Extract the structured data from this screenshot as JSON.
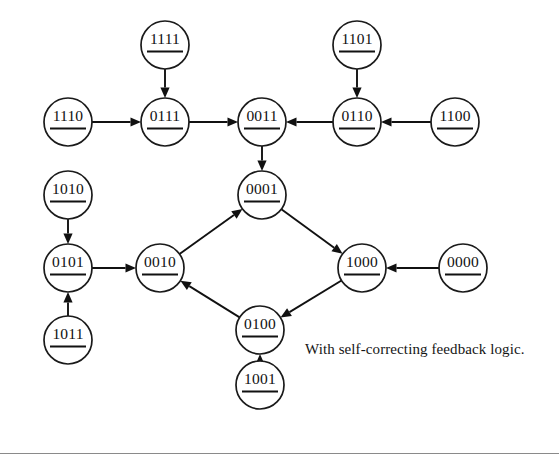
{
  "figure": {
    "caption": "With self-correcting feedback logic.",
    "caption_x": 305,
    "caption_y": 341,
    "background_color": "#ffffff",
    "stroke_color": "#111111",
    "node_radius": 24,
    "footer_rule_y": 453,
    "footer_rule_color": "#8a8a8a"
  },
  "chart_data": {
    "type": "diagram",
    "subtitle": "With self-correcting feedback logic.",
    "node_shape": "circle-with-underline",
    "nodes": [
      {
        "id": "1111",
        "label": "1111",
        "x": 165,
        "y": 45
      },
      {
        "id": "1101",
        "label": "1101",
        "x": 357,
        "y": 45
      },
      {
        "id": "1110",
        "label": "1110",
        "x": 68,
        "y": 122
      },
      {
        "id": "0111",
        "label": "0111",
        "x": 165,
        "y": 122
      },
      {
        "id": "0011",
        "label": "0011",
        "x": 262,
        "y": 122
      },
      {
        "id": "0110",
        "label": "0110",
        "x": 357,
        "y": 122
      },
      {
        "id": "1100",
        "label": "1100",
        "x": 455,
        "y": 122
      },
      {
        "id": "1010",
        "label": "1010",
        "x": 68,
        "y": 195
      },
      {
        "id": "0001",
        "label": "0001",
        "x": 262,
        "y": 195
      },
      {
        "id": "0101",
        "label": "0101",
        "x": 68,
        "y": 268
      },
      {
        "id": "0010",
        "label": "0010",
        "x": 160,
        "y": 268
      },
      {
        "id": "1000",
        "label": "1000",
        "x": 362,
        "y": 268
      },
      {
        "id": "0000",
        "label": "0000",
        "x": 463,
        "y": 268
      },
      {
        "id": "1011",
        "label": "1011",
        "x": 68,
        "y": 340
      },
      {
        "id": "0100",
        "label": "0100",
        "x": 260,
        "y": 330
      },
      {
        "id": "1001",
        "label": "1001",
        "x": 260,
        "y": 385
      }
    ],
    "edges": [
      {
        "from": "1111",
        "to": "0111"
      },
      {
        "from": "1110",
        "to": "0111"
      },
      {
        "from": "0111",
        "to": "0011"
      },
      {
        "from": "1101",
        "to": "0110"
      },
      {
        "from": "1100",
        "to": "0110"
      },
      {
        "from": "0110",
        "to": "0011"
      },
      {
        "from": "0011",
        "to": "0001"
      },
      {
        "from": "1010",
        "to": "0101"
      },
      {
        "from": "1011",
        "to": "0101"
      },
      {
        "from": "0101",
        "to": "0010"
      },
      {
        "from": "0010",
        "to": "0001"
      },
      {
        "from": "0001",
        "to": "1000"
      },
      {
        "from": "0000",
        "to": "1000"
      },
      {
        "from": "1000",
        "to": "0100"
      },
      {
        "from": "0100",
        "to": "0010"
      },
      {
        "from": "1001",
        "to": "0100"
      }
    ]
  }
}
